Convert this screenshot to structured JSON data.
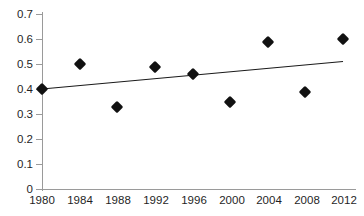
{
  "chart_data": {
    "type": "scatter",
    "title": "",
    "xlabel": "",
    "ylabel": "",
    "x": [
      1980,
      1984,
      1988,
      1992,
      1996,
      2000,
      2004,
      2008,
      2012
    ],
    "values": [
      0.4,
      0.5,
      0.33,
      0.49,
      0.46,
      0.35,
      0.59,
      0.39,
      0.6
    ],
    "series": [
      {
        "name": "data",
        "marker": "diamond",
        "color": "#111111",
        "values": [
          0.4,
          0.5,
          0.33,
          0.49,
          0.46,
          0.35,
          0.59,
          0.39,
          0.6
        ]
      },
      {
        "name": "linear-trend",
        "type": "line",
        "color": "#1a1a1a",
        "x": [
          1980,
          2012
        ],
        "values": [
          0.4,
          0.51
        ]
      }
    ],
    "xlim": [
      1980,
      2012
    ],
    "ylim": [
      0,
      0.7
    ],
    "xticks": [
      "1980",
      "1984",
      "1988",
      "1992",
      "1996",
      "2000",
      "2004",
      "2008",
      "2012"
    ],
    "yticks": [
      "0",
      "0.1",
      "0.2",
      "0.3",
      "0.4",
      "0.5",
      "0.6",
      "0.7"
    ],
    "grid": false,
    "legend": "none"
  },
  "axes": {
    "y_tick_labels": [
      "0.7",
      "0.6",
      "0.5",
      "0.4",
      "0.3",
      "0.2",
      "0.1",
      "0"
    ],
    "x_tick_labels": [
      "1980",
      "1984",
      "1988",
      "1992",
      "1996",
      "2000",
      "2004",
      "2008",
      "2012"
    ]
  },
  "colors": {
    "marker": "#111111",
    "trendline": "#1a1a1a",
    "axis": "#9a9a9a",
    "background": "#ffffff",
    "text": "#1f1f1f"
  }
}
